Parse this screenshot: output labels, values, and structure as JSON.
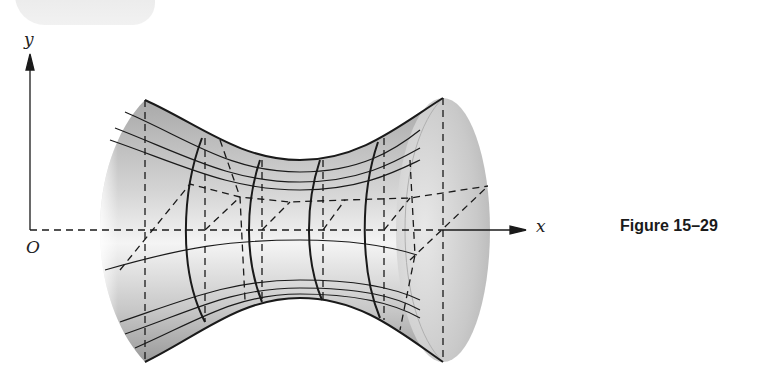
{
  "figure": {
    "caption": "Figure 15–29",
    "axes": {
      "x_label": "x",
      "y_label": "y",
      "origin_label": "O"
    },
    "surface": {
      "type": "hyperboloid-of-one-sheet",
      "orientation": "axis along x",
      "grid": "curved cross-sections with dashed hidden lines and diagonal construction lines"
    },
    "colors": {
      "ink": "#1a1a1a",
      "shade_dark": "#9a9a9a",
      "shade_light": "#f2f2f2",
      "background": "#ffffff"
    }
  }
}
